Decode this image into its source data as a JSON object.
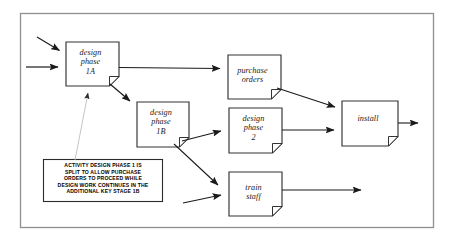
{
  "diagram": {
    "frame": {
      "x": 20,
      "y": 13,
      "width": 414,
      "height": 215,
      "stroke": "#8a8a8a"
    },
    "colors": {
      "node_stroke": "#333333",
      "node_fill": "#ffffff",
      "arrow": "#1a1a1a",
      "thin_pointer": "#b5b5b5",
      "note_stroke": "#2b2b2b",
      "text": "#1a1a1a"
    },
    "nodes": [
      {
        "id": "design-phase-1a",
        "label": "design\nphase\n1A",
        "x": 66,
        "y": 42,
        "width": 53,
        "height": 44
      },
      {
        "id": "purchase-orders",
        "label": "purchase\norders",
        "x": 228,
        "y": 55,
        "width": 53,
        "height": 44
      },
      {
        "id": "design-phase-1b",
        "label": "design\nphase\n1B",
        "x": 137,
        "y": 102,
        "width": 52,
        "height": 45
      },
      {
        "id": "design-phase-2",
        "label": "design\nphase\n2",
        "x": 229,
        "y": 108,
        "width": 53,
        "height": 45
      },
      {
        "id": "install",
        "label": "install",
        "x": 342,
        "y": 101,
        "width": 56,
        "height": 45
      },
      {
        "id": "train-staff",
        "label": "train\nstaff",
        "x": 229,
        "y": 172,
        "width": 53,
        "height": 44
      }
    ],
    "note": {
      "id": "activity-note",
      "x": 43,
      "y": 159,
      "width": 120,
      "height": 43,
      "lines": [
        "ACTIVITY DESIGN PHASE 1 IS",
        "SPLIT TO ALLOW PURCHASE",
        "ORDERS TO PROCEED  WHILE",
        "DESIGN WORK CONTINUES IN THE",
        "ADDITIONAL KEY STAGE 1B"
      ],
      "text": "ACTIVITY DESIGN PHASE 1 IS\nSPLIT TO ALLOW PURCHASE\nORDERS TO PROCEED  WHILE\nDESIGN WORK CONTINUES IN THE\nADDITIONAL KEY STAGE 1B"
    },
    "connectors": [
      {
        "id": "input-diagonal-to-1a",
        "from": "external",
        "to": "design-phase-1a",
        "kind": "arrow"
      },
      {
        "id": "input-horizontal-to-1a",
        "from": "external",
        "to": "design-phase-1a",
        "kind": "arrow"
      },
      {
        "id": "1a-to-purchase-orders",
        "from": "design-phase-1a",
        "to": "purchase-orders",
        "kind": "arrow"
      },
      {
        "id": "1a-to-1b",
        "from": "design-phase-1a",
        "to": "design-phase-1b",
        "kind": "arrow"
      },
      {
        "id": "purchase-orders-to-install",
        "from": "purchase-orders",
        "to": "install",
        "kind": "arrow"
      },
      {
        "id": "1b-to-design-phase-2",
        "from": "design-phase-1b",
        "to": "design-phase-2",
        "kind": "arrow"
      },
      {
        "id": "1b-to-train-staff",
        "from": "design-phase-1b",
        "to": "train-staff",
        "kind": "arrow"
      },
      {
        "id": "design-phase-2-to-install",
        "from": "design-phase-2",
        "to": "install",
        "kind": "arrow"
      },
      {
        "id": "install-output",
        "from": "install",
        "to": "external",
        "kind": "arrow"
      },
      {
        "id": "input-to-train-staff",
        "from": "external",
        "to": "train-staff",
        "kind": "arrow"
      },
      {
        "id": "train-staff-output",
        "from": "train-staff",
        "to": "external",
        "kind": "arrow"
      },
      {
        "id": "note-pointer-to-1a",
        "from": "activity-note",
        "to": "design-phase-1a",
        "kind": "thin-arrow"
      }
    ]
  }
}
